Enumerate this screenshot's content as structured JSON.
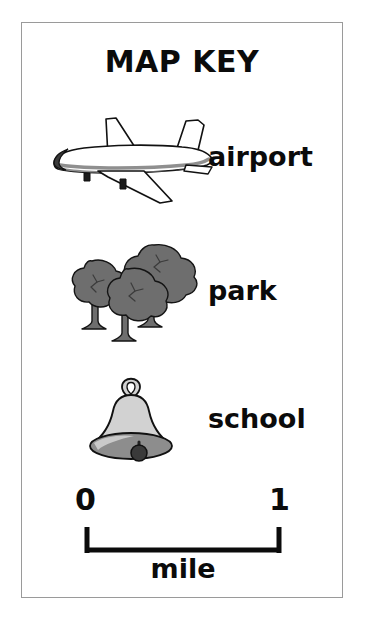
{
  "card": {
    "title": "MAP KEY",
    "border_color": "#9a9a9a",
    "background": "#ffffff"
  },
  "legend": {
    "entries": [
      {
        "label": "airport",
        "icon": "airplane-icon",
        "icon_colors": {
          "body": "#ffffff",
          "stripe": "#8f8f8f",
          "nose": "#3a3a3a",
          "outline": "#111111"
        }
      },
      {
        "label": "park",
        "icon": "trees-icon",
        "icon_colors": {
          "canopy": "#6e6e6e",
          "trunk": "#6e6e6e",
          "outline": "#141414"
        }
      },
      {
        "label": "school",
        "icon": "bell-icon",
        "icon_colors": {
          "body": "#d2d2d2",
          "rim": "#8d8d8d",
          "clapper": "#3a3a3a",
          "outline": "#111111"
        }
      }
    ]
  },
  "scale": {
    "start_label": "0",
    "end_label": "1",
    "unit_label": "mile",
    "line_color": "#0b0b0b"
  }
}
